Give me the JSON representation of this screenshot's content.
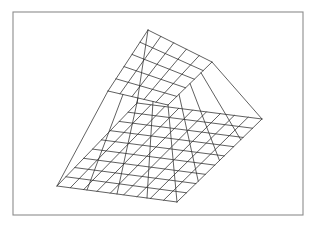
{
  "figure": {
    "title": "",
    "kind": "3d-wireframe-mesh-surface",
    "description": "3D wireframe mesh surface plot of a truncated pyramid (plateau) drawn in black line on white background inside a thin grey rectangular frame",
    "background_color": "#ffffff",
    "frame_color": "#8c8c8c",
    "mesh_color": "#2b2b2b",
    "width": 318,
    "height": 229
  },
  "frame": {
    "x": 13,
    "y": 12,
    "width": 290,
    "height": 203
  },
  "chart_data": {
    "type": "surface",
    "title": "",
    "xlabel": "",
    "ylabel": "",
    "zlabel": "",
    "grid": true,
    "legend": false,
    "projection": "parallel-oblique",
    "nx": 9,
    "ny": 9,
    "x": [
      0,
      1,
      2,
      3,
      4,
      5,
      6,
      7,
      8,
      9
    ],
    "y": [
      0,
      1,
      2,
      3,
      4,
      5,
      6,
      7,
      8,
      9
    ],
    "zlim": [
      0,
      1
    ],
    "plateau": {
      "z": 1,
      "i_start": 2,
      "i_end": 7,
      "j_start": 2,
      "j_end": 7
    },
    "values": [
      [
        0,
        0,
        0,
        0,
        0,
        0,
        0,
        0,
        0,
        0
      ],
      [
        0,
        0,
        0,
        0,
        0,
        0,
        0,
        0,
        0,
        0
      ],
      [
        0,
        0,
        1,
        1,
        1,
        1,
        1,
        1,
        0,
        0
      ],
      [
        0,
        0,
        1,
        1,
        1,
        1,
        1,
        1,
        0,
        0
      ],
      [
        0,
        0,
        1,
        1,
        1,
        1,
        1,
        1,
        0,
        0
      ],
      [
        0,
        0,
        1,
        1,
        1,
        1,
        1,
        1,
        0,
        0
      ],
      [
        0,
        0,
        1,
        1,
        1,
        1,
        1,
        1,
        0,
        0
      ],
      [
        0,
        0,
        1,
        1,
        1,
        1,
        1,
        1,
        0,
        0
      ],
      [
        0,
        0,
        0,
        0,
        0,
        0,
        0,
        0,
        0,
        0
      ],
      [
        0,
        0,
        0,
        0,
        0,
        0,
        0,
        0,
        0,
        0
      ]
    ],
    "base_quad": {
      "left": [
        57,
        186
      ],
      "back": [
        137,
        103
      ],
      "right": [
        262,
        119
      ],
      "front": [
        177,
        202
      ]
    },
    "plateau_quad": {
      "left": [
        108,
        91
      ],
      "back": [
        148,
        30
      ],
      "right": [
        212,
        62
      ],
      "front": [
        168,
        105
      ]
    },
    "base_divisions_u": 9,
    "base_divisions_v": 9,
    "plateau_divisions_u": 5,
    "plateau_divisions_v": 5,
    "annotations": []
  }
}
